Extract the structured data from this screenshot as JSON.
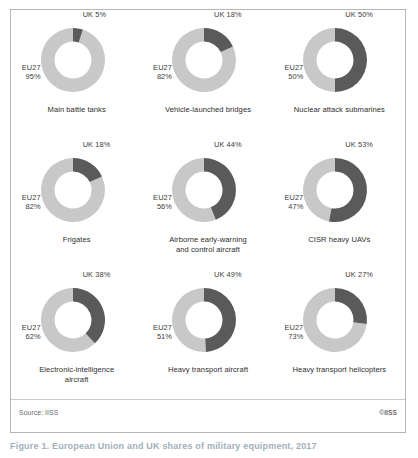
{
  "figure": {
    "source_label": "Source: IISS",
    "copyright_label": "©IISS",
    "caption": "Figure 1. European Union and UK shares of military equipment, 2017"
  },
  "colors": {
    "uk_segment": "#5a5a5a",
    "eu_segment": "#c8c8c8",
    "panel_border": "#b6b6b6",
    "label_text": "#3b3b3b",
    "caption_text": "#2e2e2e",
    "footer_text": "#6a6a6a",
    "background": "#ffffff"
  },
  "legend": {
    "uk_name": "UK",
    "eu_name": "EU27"
  },
  "chart_data": {
    "type": "pie",
    "title": "European Union and UK shares of military equipment, 2017",
    "subtitle": "",
    "xlabel": "",
    "ylabel": "",
    "layout": "3x3 grid of donut charts",
    "series_names": [
      "UK",
      "EU27"
    ],
    "legend_position": "inline-labels",
    "charts": [
      {
        "caption_lines": [
          "Main battle tanks"
        ],
        "uk_label": "UK 5%",
        "eu_name": "EU27",
        "eu_pct": "95%",
        "uk_value": 5,
        "eu_value": 95
      },
      {
        "caption_lines": [
          "Vehicle-launched bridges"
        ],
        "uk_label": "UK 18%",
        "eu_name": "EU27",
        "eu_pct": "82%",
        "uk_value": 18,
        "eu_value": 82
      },
      {
        "caption_lines": [
          "Nuclear attack submarines"
        ],
        "uk_label": "UK 50%",
        "eu_name": "EU27",
        "eu_pct": "50%",
        "uk_value": 50,
        "eu_value": 50
      },
      {
        "caption_lines": [
          "Frigates"
        ],
        "uk_label": "UK 18%",
        "eu_name": "EU27",
        "eu_pct": "82%",
        "uk_value": 18,
        "eu_value": 82
      },
      {
        "caption_lines": [
          "Airborne early-warning",
          "and control aircraft"
        ],
        "uk_label": "UK 44%",
        "eu_name": "EU27",
        "eu_pct": "56%",
        "uk_value": 44,
        "eu_value": 56
      },
      {
        "caption_lines": [
          "CISR heavy UAVs"
        ],
        "uk_label": "UK 53%",
        "eu_name": "EU27",
        "eu_pct": "47%",
        "uk_value": 53,
        "eu_value": 47
      },
      {
        "caption_lines": [
          "Electronic-intelligence",
          "aircraft"
        ],
        "uk_label": "UK 38%",
        "eu_name": "EU27",
        "eu_pct": "62%",
        "uk_value": 38,
        "eu_value": 62
      },
      {
        "caption_lines": [
          "Heavy transport aircraft"
        ],
        "uk_label": "UK 49%",
        "eu_name": "EU27",
        "eu_pct": "51%",
        "uk_value": 49,
        "eu_value": 51
      },
      {
        "caption_lines": [
          "Heavy transport helicopters"
        ],
        "uk_label": "UK 27%",
        "eu_name": "EU27",
        "eu_pct": "73%",
        "uk_value": 27,
        "eu_value": 73
      }
    ]
  }
}
